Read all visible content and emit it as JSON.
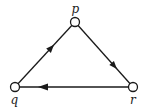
{
  "diagram": {
    "type": "directed-graph",
    "nodes": [
      {
        "id": "p",
        "label": "p",
        "x": 75,
        "y": 22
      },
      {
        "id": "q",
        "label": "q",
        "x": 15,
        "y": 87
      },
      {
        "id": "r",
        "label": "r",
        "x": 133,
        "y": 87
      }
    ],
    "edges": [
      {
        "from": "q",
        "to": "p"
      },
      {
        "from": "p",
        "to": "r"
      },
      {
        "from": "r",
        "to": "q"
      }
    ],
    "colors": {
      "stroke": "#1a1a1a",
      "node_fill": "#ffffff"
    }
  }
}
